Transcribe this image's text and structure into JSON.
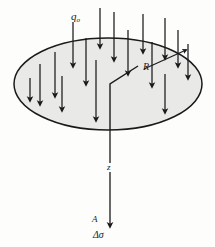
{
  "figure": {
    "background_color": "#fdfdfc",
    "line_color": "#1a1a1a",
    "loaded_area_fill": "#e9e9e7"
  },
  "labels": {
    "load_symbol": "q",
    "load_subscript": "o",
    "radius": "R",
    "depth_axis": "z",
    "point": "A",
    "stress_increase": "Δσ"
  },
  "geometry": {
    "ellipse": {
      "cx": 108,
      "cy": 84,
      "rx": 94,
      "ry": 46
    },
    "z_axis": {
      "x": 110,
      "y_top": 84,
      "y_bottom": 226
    },
    "radius_arrow": {
      "x1": 144,
      "y1": 69,
      "x2": 186,
      "y2": 50
    },
    "step_line": [
      [
        138,
        66
      ],
      [
        110,
        84
      ],
      [
        110,
        130
      ]
    ]
  },
  "chart_data": {
    "type": "diagram",
    "elements": [
      {
        "name": "loaded-circular-area",
        "shape": "ellipse",
        "label": ""
      },
      {
        "name": "uniform-load",
        "shape": "arrow-array",
        "label": "q_o",
        "direction": "down",
        "count": 16
      },
      {
        "name": "radius-marker",
        "shape": "double-arrow",
        "label": "R"
      },
      {
        "name": "depth-axis",
        "shape": "arrow",
        "label": "z",
        "direction": "down"
      },
      {
        "name": "evaluation-point",
        "shape": "point",
        "label": "A"
      },
      {
        "name": "stress-increase",
        "shape": "text",
        "label": "Δσ"
      }
    ],
    "annotations": [
      "q_o",
      "R",
      "z",
      "A",
      "Δσ"
    ]
  },
  "load_arrows": [
    {
      "x": 73,
      "y1": 22,
      "y2": 66
    },
    {
      "x": 86,
      "y1": 38,
      "y2": 84
    },
    {
      "x": 55,
      "y1": 52,
      "y2": 96
    },
    {
      "x": 40,
      "y1": 64,
      "y2": 104
    },
    {
      "x": 100,
      "y1": 8,
      "y2": 47
    },
    {
      "x": 114,
      "y1": 12,
      "y2": 60
    },
    {
      "x": 128,
      "y1": 30,
      "y2": 74
    },
    {
      "x": 96,
      "y1": 60,
      "y2": 120
    },
    {
      "x": 143,
      "y1": 14,
      "y2": 52
    },
    {
      "x": 152,
      "y1": 42,
      "y2": 86
    },
    {
      "x": 165,
      "y1": 18,
      "y2": 58
    },
    {
      "x": 165,
      "y1": 74,
      "y2": 112
    },
    {
      "x": 178,
      "y1": 30,
      "y2": 66
    },
    {
      "x": 188,
      "y1": 44,
      "y2": 78
    },
    {
      "x": 62,
      "y1": 76,
      "y2": 110
    },
    {
      "x": 30,
      "y1": 78,
      "y2": 100
    }
  ]
}
